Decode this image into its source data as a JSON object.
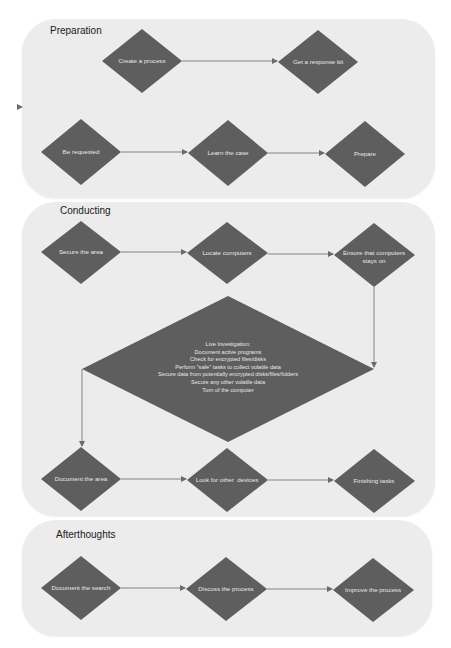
{
  "colors": {
    "panel_bg": "#ececec",
    "node_fill": "#5e5e5e",
    "node_text": "#e8e8e8",
    "connector": "#6b6b6b",
    "title_text": "#1a1a1a"
  },
  "panels": [
    {
      "id": "preparation",
      "title": "Preparation",
      "nodes": [
        {
          "id": "create-process",
          "label": "Create a process"
        },
        {
          "id": "get-response-kit",
          "label": "Get a response kit"
        },
        {
          "id": "be-requested",
          "label": "Be requested"
        },
        {
          "id": "learn-case",
          "label": "Learn the case"
        },
        {
          "id": "prepare",
          "label": "Prepare"
        }
      ]
    },
    {
      "id": "conducting",
      "title": "Conducting",
      "nodes": [
        {
          "id": "secure-area",
          "label": "Secure the area"
        },
        {
          "id": "locate-computers",
          "label": "Locate computers"
        },
        {
          "id": "ensure-on",
          "label": "Ensure that computers stays on"
        },
        {
          "id": "document-area",
          "label": "Document the area"
        },
        {
          "id": "look-other-devices",
          "label": "Look for other  devices"
        },
        {
          "id": "finishing-tasks",
          "label": "Finishing tasks"
        }
      ],
      "live_investigation": {
        "lines": [
          "Live Investigation:",
          "Document active programs",
          "Check for encrypted files/disks",
          "Perform \"safe\" tasks to collect volatile data",
          "Secure data from potentially encrypted disks/files/folders",
          "Secure any other volatile data",
          "Turn of the computer"
        ]
      }
    },
    {
      "id": "afterthoughts",
      "title": "Afterthoughts",
      "nodes": [
        {
          "id": "document-search",
          "label": "Document the search"
        },
        {
          "id": "discuss-process",
          "label": "Discuss the process"
        },
        {
          "id": "improve-process",
          "label": "Improve the process"
        }
      ]
    }
  ],
  "edges": [
    [
      "create-process",
      "get-response-kit"
    ],
    [
      "be-requested",
      "learn-case"
    ],
    [
      "learn-case",
      "prepare"
    ],
    [
      "secure-area",
      "locate-computers"
    ],
    [
      "locate-computers",
      "ensure-on"
    ],
    [
      "ensure-on",
      "live-investigation"
    ],
    [
      "live-investigation",
      "document-area"
    ],
    [
      "document-area",
      "look-other-devices"
    ],
    [
      "look-other-devices",
      "finishing-tasks"
    ],
    [
      "document-search",
      "discuss-process"
    ],
    [
      "discuss-process",
      "improve-process"
    ]
  ]
}
